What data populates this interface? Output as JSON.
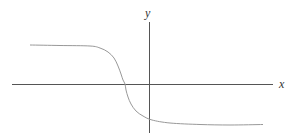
{
  "chart_data": {
    "type": "line",
    "title": "",
    "xlabel": "x",
    "ylabel": "y",
    "grid": false,
    "legend": null,
    "axes": {
      "x_axis": {
        "label": "x",
        "ticks": []
      },
      "y_axis": {
        "label": "y",
        "ticks": []
      }
    },
    "series": [
      {
        "name": "curve",
        "color": "#999999",
        "points_px": [
          [
            30,
            45
          ],
          [
            60,
            45.5
          ],
          [
            90,
            46
          ],
          [
            100,
            48
          ],
          [
            108,
            52
          ],
          [
            114,
            58
          ],
          [
            118,
            66
          ],
          [
            121,
            74
          ],
          [
            123,
            80
          ],
          [
            125,
            84
          ],
          [
            126,
            90
          ],
          [
            128,
            97
          ],
          [
            131,
            104
          ],
          [
            136,
            111
          ],
          [
            143,
            116
          ],
          [
            152,
            120
          ],
          [
            170,
            123
          ],
          [
            200,
            124.5
          ],
          [
            230,
            125
          ],
          [
            263,
            124.5
          ]
        ]
      }
    ]
  },
  "labels": {
    "x": "x",
    "y": "y"
  },
  "colors": {
    "axis": "#555555",
    "curve": "#999999",
    "background": "#ffffff"
  }
}
